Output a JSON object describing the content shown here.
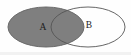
{
  "figure": {
    "kind": "venn-diagram",
    "background_color": "#fefefe",
    "width": 131,
    "height": 55
  },
  "sets": [
    {
      "id": "A",
      "label": "A",
      "shaded": true,
      "fill_color": "#7f7f7f",
      "stroke_color": "#6a6a6a",
      "label_color": "#1c1c1c",
      "center_x": 46,
      "center_y": 27,
      "radius_x": 38,
      "radius_y": 20,
      "label_x": 43,
      "label_y": 28
    },
    {
      "id": "B",
      "label": "B",
      "shaded": false,
      "fill_color": "#ffffff",
      "stroke_color": "#555555",
      "label_color": "#1c1c1c",
      "center_x": 88,
      "center_y": 27,
      "radius_x": 37,
      "radius_y": 20,
      "label_x": 89,
      "label_y": 26
    }
  ],
  "intersection": {
    "shaded": true,
    "fill_color": "#7f7f7f"
  }
}
